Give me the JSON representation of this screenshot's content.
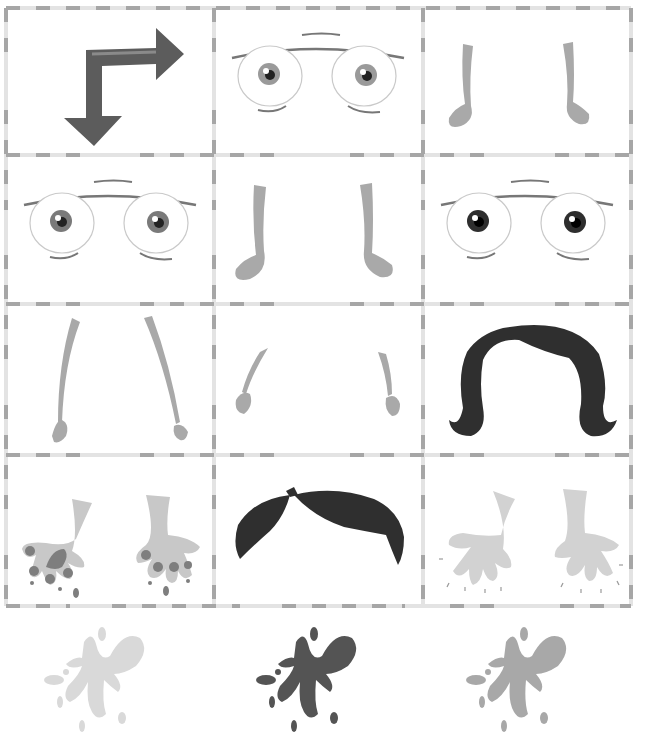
{
  "sheet": {
    "title": "Cut-out face and limb pieces",
    "grid": {
      "left": 6,
      "top": 8,
      "right": 631,
      "bottom": 606,
      "col_x": [
        6,
        214,
        423,
        631
      ],
      "row_y": [
        8,
        155,
        304,
        455,
        606
      ],
      "line_color": "#a8a8a8",
      "line_light_color": "#e2e2e2"
    },
    "cells": [
      {
        "row": 0,
        "col": 0,
        "piece": "turn-arrow-icon",
        "color": "#5c5c5c"
      },
      {
        "row": 0,
        "col": 1,
        "piece": "eyes-grey-iris",
        "iris_color": "#9a9a9a"
      },
      {
        "row": 0,
        "col": 2,
        "piece": "legs-with-feet",
        "color": "#a9a9a9"
      },
      {
        "row": 1,
        "col": 0,
        "piece": "eyes-dark-grey-iris",
        "iris_color": "#7a7a7a"
      },
      {
        "row": 1,
        "col": 1,
        "piece": "legs-with-feet",
        "color": "#a9a9a9"
      },
      {
        "row": 1,
        "col": 2,
        "piece": "eyes-black-iris",
        "iris_color": "#2e2e2e"
      },
      {
        "row": 2,
        "col": 0,
        "piece": "long-arms",
        "color": "#a9a9a9"
      },
      {
        "row": 2,
        "col": 1,
        "piece": "short-arms",
        "color": "#a9a9a9"
      },
      {
        "row": 2,
        "col": 2,
        "piece": "long-hair",
        "color": "#2f2f2f"
      },
      {
        "row": 3,
        "col": 0,
        "piece": "paint-dipped-hands",
        "color": "#c8c8c8",
        "paint_color": "#7e7e7e"
      },
      {
        "row": 3,
        "col": 1,
        "piece": "short-hair",
        "color": "#2f2f2f"
      },
      {
        "row": 3,
        "col": 2,
        "piece": "clean-hands",
        "color": "#d2d2d2"
      }
    ],
    "splats": [
      {
        "name": "light-paint-splat",
        "color": "#d9d9d9",
        "x": 40,
        "y": 622
      },
      {
        "name": "dark-paint-splat",
        "color": "#545454",
        "x": 252,
        "y": 622
      },
      {
        "name": "medium-paint-splat",
        "color": "#a8a8a8",
        "x": 462,
        "y": 622
      }
    ]
  }
}
